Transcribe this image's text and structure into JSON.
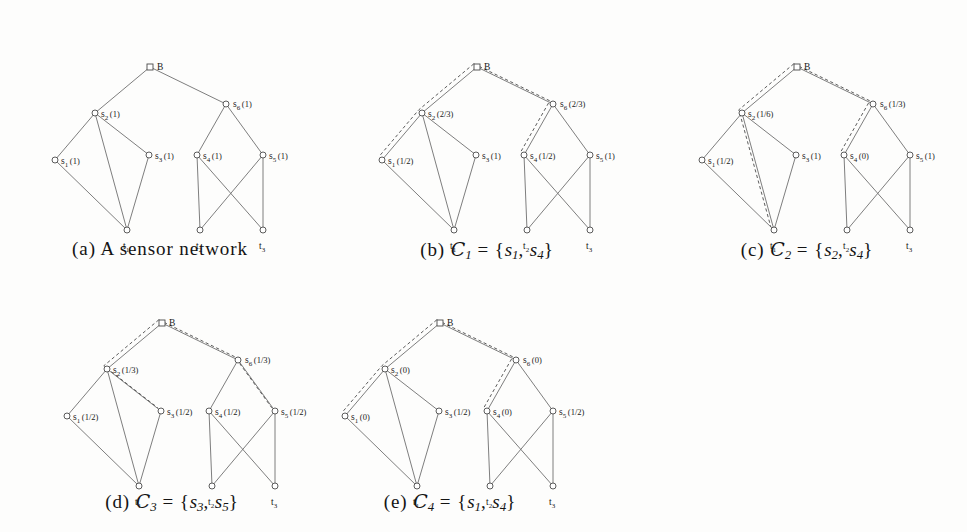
{
  "figure": {
    "background": "#fdfdfc",
    "edge_color": "#6f6f6f",
    "dash_color": "#4a4a4a",
    "node_stroke": "#4a4a4a"
  },
  "graph": {
    "nodes": [
      {
        "id": "B",
        "shape": "square",
        "x": 140,
        "y": 45,
        "label": "B",
        "sub": "",
        "lx": 7,
        "ly": 3
      },
      {
        "id": "s6",
        "shape": "circle",
        "x": 216,
        "y": 82,
        "label": "s",
        "sub": "6",
        "lx": 7,
        "ly": 3
      },
      {
        "id": "s2",
        "shape": "circle",
        "x": 85,
        "y": 91,
        "label": "s",
        "sub": "2",
        "lx": 6,
        "ly": 4
      },
      {
        "id": "s1",
        "shape": "circle",
        "x": 45,
        "y": 138,
        "label": "s",
        "sub": "1",
        "lx": 6,
        "ly": 4
      },
      {
        "id": "s3",
        "shape": "circle",
        "x": 139,
        "y": 133,
        "label": "s",
        "sub": "3",
        "lx": 6,
        "ly": 4
      },
      {
        "id": "s4",
        "shape": "circle",
        "x": 187,
        "y": 133,
        "label": "s",
        "sub": "4",
        "lx": 6,
        "ly": 4
      },
      {
        "id": "s5",
        "shape": "circle",
        "x": 253,
        "y": 133,
        "label": "s",
        "sub": "5",
        "lx": 6,
        "ly": 4
      },
      {
        "id": "t1",
        "shape": "circle",
        "x": 117,
        "y": 208,
        "label": "t",
        "sub": "1",
        "lx": -4,
        "ly": 19
      },
      {
        "id": "t2",
        "shape": "circle",
        "x": 190,
        "y": 208,
        "label": "t",
        "sub": "2",
        "lx": -4,
        "ly": 19
      },
      {
        "id": "t3",
        "shape": "circle",
        "x": 253,
        "y": 208,
        "label": "t",
        "sub": "3",
        "lx": -4,
        "ly": 19
      }
    ],
    "edges": [
      [
        "B",
        "s2"
      ],
      [
        "B",
        "s6"
      ],
      [
        "s2",
        "s1"
      ],
      [
        "s2",
        "s3"
      ],
      [
        "s2",
        "t1"
      ],
      [
        "s1",
        "t1"
      ],
      [
        "s3",
        "t1"
      ],
      [
        "s6",
        "s4"
      ],
      [
        "s6",
        "s5"
      ],
      [
        "s4",
        "t2"
      ],
      [
        "s4",
        "t3"
      ],
      [
        "s5",
        "t2"
      ],
      [
        "s5",
        "t3"
      ]
    ]
  },
  "panels": [
    {
      "key": "a",
      "caption_prefix": "(a)",
      "caption_text": "A sensor network",
      "caption_kind": "text",
      "weights": {
        "s1": "(1)",
        "s2": "(1)",
        "s3": "(1)",
        "s4": "(1)",
        "s5": "(1)",
        "s6": "(1)"
      },
      "dashed": []
    },
    {
      "key": "b",
      "caption_prefix": "(b)",
      "caption_kind": "set",
      "set_symbol": "C",
      "set_index": "1",
      "set_members": [
        "s1",
        "s4"
      ],
      "caption_text": "C1 = {s1, s4}",
      "weights": {
        "s1": "(1/2)",
        "s2": "(2/3)",
        "s3": "(1)",
        "s4": "(1/2)",
        "s5": "(1)",
        "s6": "(2/3)"
      },
      "dashed": [
        [
          "B",
          "s2",
          "s1"
        ],
        [
          "B",
          "s6",
          "s4"
        ]
      ]
    },
    {
      "key": "c",
      "caption_prefix": "(c)",
      "caption_kind": "set",
      "set_symbol": "C",
      "set_index": "2",
      "set_members": [
        "s2",
        "s4"
      ],
      "caption_text": "C2 = {s2, s4}",
      "weights": {
        "s1": "(1/2)",
        "s2": "(1/6)",
        "s3": "(1)",
        "s4": "(0)",
        "s5": "(1)",
        "s6": "(1/3)"
      },
      "dashed": [
        [
          "B",
          "s2",
          "t1"
        ],
        [
          "B",
          "s6",
          "s4"
        ]
      ]
    },
    {
      "key": "d",
      "caption_prefix": "(d)",
      "caption_kind": "set",
      "set_symbol": "C",
      "set_index": "3",
      "set_members": [
        "s3",
        "s5"
      ],
      "caption_text": "C3 = {s3, s5}",
      "weights": {
        "s1": "(1/2)",
        "s2": "(1/3)",
        "s3": "(1/2)",
        "s4": "(1/2)",
        "s5": "(1/2)",
        "s6": "(1/3)"
      },
      "dashed": [
        [
          "B",
          "s2",
          "s3"
        ],
        [
          "B",
          "s6",
          "s5"
        ]
      ]
    },
    {
      "key": "e",
      "caption_prefix": "(e)",
      "caption_kind": "set",
      "set_symbol": "C",
      "set_index": "4",
      "set_members": [
        "s1",
        "s4"
      ],
      "caption_text": "C4 = {s1, s4}",
      "weights": {
        "s1": "(0)",
        "s2": "(0)",
        "s3": "(1/2)",
        "s4": "(0)",
        "s5": "(1/2)",
        "s6": "(0)"
      },
      "dashed": [
        [
          "B",
          "s2",
          "s1"
        ],
        [
          "B",
          "s6",
          "s4"
        ]
      ]
    }
  ],
  "layout": {
    "panel_positions": [
      {
        "key": "a",
        "left": 10,
        "top": 22,
        "caption_top": 238
      },
      {
        "key": "b",
        "left": 337,
        "top": 22,
        "caption_top": 238
      },
      {
        "key": "c",
        "left": 657,
        "top": 22,
        "caption_top": 238
      },
      {
        "key": "d",
        "left": 22,
        "top": 278,
        "caption_top": 490
      },
      {
        "key": "e",
        "left": 300,
        "top": 278,
        "caption_top": 490
      }
    ],
    "panel_width": 300,
    "panel_height": 230
  }
}
